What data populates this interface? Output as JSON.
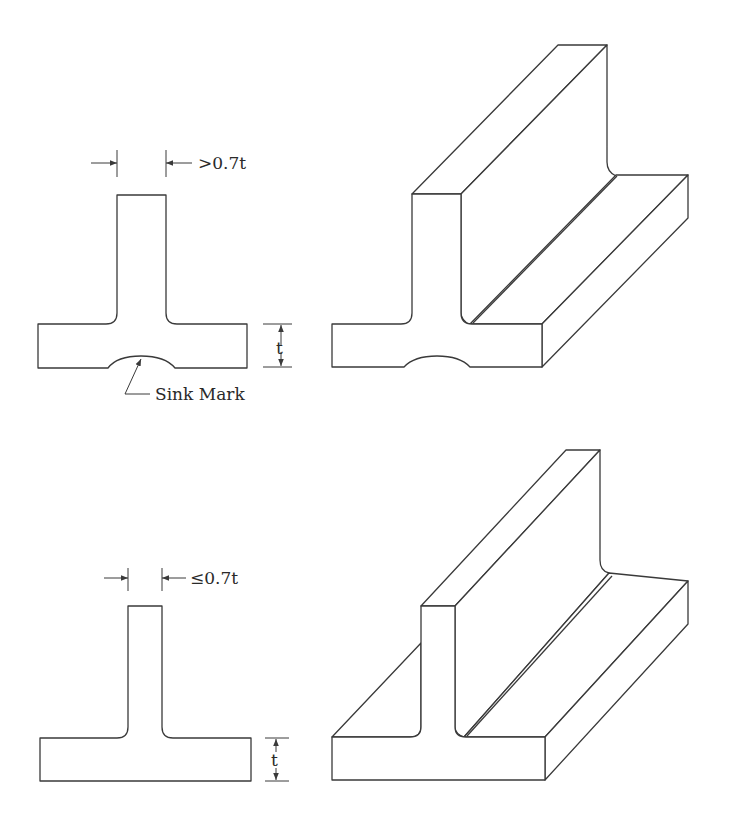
{
  "diagram": {
    "type": "engineering-illustration",
    "panels": [
      {
        "id": "top",
        "rib_dimension_label": ">0.7t",
        "wall_dimension_label": "t",
        "callout_label": "Sink Mark",
        "has_sink_mark": true
      },
      {
        "id": "bottom",
        "rib_dimension_label": "≤0.7t",
        "wall_dimension_label": "t",
        "has_sink_mark": false
      }
    ],
    "colors": {
      "line": "#3a3a3a",
      "background": "#ffffff"
    }
  }
}
